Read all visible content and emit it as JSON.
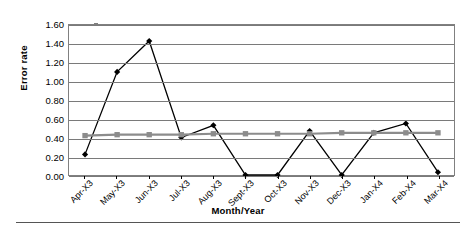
{
  "chart_data": {
    "type": "line",
    "title": "",
    "xlabel": "Month/Year",
    "ylabel": "Error rate",
    "ylim": [
      0.0,
      1.6
    ],
    "ytick_step": 0.2,
    "grid": true,
    "legend": "none",
    "categories": [
      "Apr-X3",
      "May-X3",
      "Jun-X3",
      "Jul-X3",
      "Aug-X3",
      "Sept-X3",
      "Oct-X3",
      "Nov-X3",
      "Dec-X3",
      "Jan-X4",
      "Feb-X4",
      "Mar-X4"
    ],
    "ytick_labels": [
      "0.00",
      "0.20",
      "0.40",
      "0.60",
      "0.80",
      "1.00",
      "1.20",
      "1.40",
      "1.60"
    ],
    "series": [
      {
        "name": "error-rate-series",
        "marker": "diamond",
        "color": "#000000",
        "values": [
          0.22,
          1.1,
          1.43,
          0.4,
          0.53,
          0.0,
          0.0,
          0.47,
          0.0,
          0.45,
          0.55,
          0.03
        ]
      },
      {
        "name": "baseline-series",
        "marker": "square",
        "color": "#8c8c8c",
        "values": [
          0.42,
          0.43,
          0.43,
          0.43,
          0.44,
          0.44,
          0.44,
          0.44,
          0.45,
          0.45,
          0.45,
          0.45
        ]
      }
    ]
  },
  "colors": {
    "series_primary": "#000000",
    "series_secondary": "#8c8c8c",
    "gridline": "#7a7a7a",
    "plot_border": "#808080",
    "background": "#ffffff"
  }
}
